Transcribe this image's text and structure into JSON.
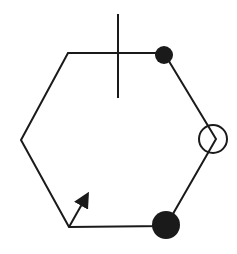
{
  "diagram": {
    "type": "hexagon-with-markers",
    "background": "#ffffff",
    "stroke_color": "#1a1a1a",
    "hexagon": {
      "vertices": [
        [
          68,
          53
        ],
        [
          164,
          53
        ],
        [
          216,
          139
        ],
        [
          166,
          226
        ],
        [
          69,
          227
        ],
        [
          21,
          140
        ]
      ]
    },
    "markers": [
      {
        "kind": "filled-dot",
        "name": "top-right-vertex-dot",
        "cx": 164,
        "cy": 55,
        "r": 9
      },
      {
        "kind": "open-circle",
        "name": "right-vertex-circle",
        "cx": 213,
        "cy": 139,
        "r": 14
      },
      {
        "kind": "filled-dot",
        "name": "bottom-right-vertex-dot",
        "cx": 166,
        "cy": 225,
        "r": 14
      }
    ],
    "tick_line": {
      "x": 118,
      "y1": 14,
      "y2": 98
    },
    "arrow": {
      "x1": 69,
      "y1": 227,
      "x2": 86,
      "y2": 197
    }
  }
}
